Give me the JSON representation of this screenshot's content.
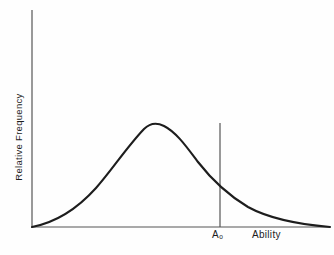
{
  "figure": {
    "background_color": "#fefefe",
    "width": 334,
    "height": 255
  },
  "axes": {
    "line_color": "#555555",
    "origin_x": 32,
    "origin_y": 227,
    "x_axis_end": 330,
    "y_axis_top": 10
  },
  "labels": {
    "ylabel": "Relative Frequency",
    "xlabel": "Ability",
    "threshold_label_main": "A",
    "threshold_label_sub": "o"
  },
  "marker": {
    "name": "threshold-line",
    "x": 220,
    "top_y": 123,
    "bottom_y": 227,
    "color": "#555555"
  },
  "curve": {
    "color": "#1d1d1d",
    "width": 2.1,
    "path": "M 32 227 C 58 222, 78 208, 96 188 C 112 170, 126 148, 144 129 C 149 124, 156 122, 164 126 C 176 132, 186 146, 198 162 C 212 180, 228 195, 248 207 C 268 218, 295 224, 330 227"
  },
  "chart_data": {
    "type": "line",
    "title": "",
    "subtitle": "",
    "xlabel": "Ability",
    "ylabel": "Relative Frequency",
    "grid": false,
    "legend": null,
    "xlim": [
      0,
      1
    ],
    "ylim": [
      0,
      1
    ],
    "x_tick_labels": [
      "A₀"
    ],
    "y_tick_labels": [],
    "annotations": [
      {
        "text": "A₀",
        "type": "vertical-threshold-line",
        "x_normalized": 0.63,
        "description": "Vertical reference line dropped from the curve to the x-axis at ability level A-sub-o"
      }
    ],
    "series": [
      {
        "name": "Relative frequency of ability",
        "shape": "right-skewed unimodal distribution",
        "peak_x_normalized": 0.39,
        "peak_y_normalized": 0.82,
        "x": [
          0.0,
          0.05,
          0.1,
          0.15,
          0.2,
          0.25,
          0.3,
          0.35,
          0.39,
          0.45,
          0.5,
          0.55,
          0.6,
          0.63,
          0.7,
          0.75,
          0.8,
          0.85,
          0.9,
          0.95,
          1.0
        ],
        "y": [
          0.0,
          0.05,
          0.12,
          0.22,
          0.36,
          0.52,
          0.68,
          0.79,
          0.82,
          0.8,
          0.74,
          0.66,
          0.56,
          0.5,
          0.38,
          0.3,
          0.23,
          0.16,
          0.1,
          0.05,
          0.0
        ]
      }
    ]
  }
}
